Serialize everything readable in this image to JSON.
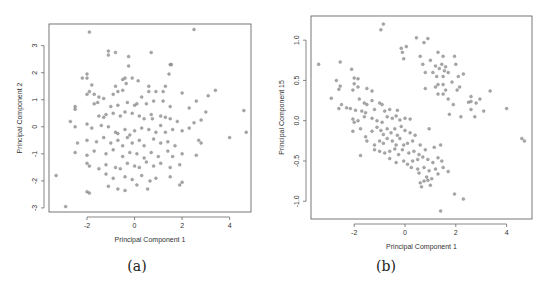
{
  "chart_data": [
    {
      "type": "scatter",
      "panel_label": "(a)",
      "xlabel": "Principal Component 1",
      "ylabel": "Principal Component 2",
      "xticks": [
        -2,
        0,
        2,
        4
      ],
      "yticks": [
        -3,
        -2,
        -1,
        0,
        1,
        2,
        3
      ],
      "xlim": [
        -3.6,
        4.9
      ],
      "ylim": [
        -3.15,
        3.8
      ],
      "grid": false,
      "legend": null,
      "point_color": "#8a8a8a",
      "points": [
        [
          -1.9,
          3.5
        ],
        [
          2.5,
          3.6
        ],
        [
          -1.1,
          2.8
        ],
        [
          -1.1,
          2.65
        ],
        [
          -0.8,
          2.75
        ],
        [
          -0.25,
          2.6
        ],
        [
          0.7,
          2.75
        ],
        [
          -0.25,
          2.25
        ],
        [
          1.5,
          2.3
        ],
        [
          1.55,
          2.3
        ],
        [
          1.45,
          1.95
        ],
        [
          -2.0,
          1.95
        ],
        [
          -2.0,
          1.8
        ],
        [
          -2.2,
          1.8
        ],
        [
          -0.4,
          1.8
        ],
        [
          -0.5,
          1.75
        ],
        [
          -0.1,
          1.8
        ],
        [
          0.15,
          1.7
        ],
        [
          -0.35,
          1.6
        ],
        [
          -1.8,
          1.55
        ],
        [
          -0.8,
          1.5
        ],
        [
          0.6,
          1.5
        ],
        [
          1.3,
          1.5
        ],
        [
          -1.9,
          1.3
        ],
        [
          -1.7,
          1.2
        ],
        [
          -2.0,
          1.2
        ],
        [
          -1.5,
          1.1
        ],
        [
          -1.3,
          1.05
        ],
        [
          -0.9,
          1.2
        ],
        [
          -0.7,
          1.3
        ],
        [
          -0.5,
          1.35
        ],
        [
          0.3,
          1.1
        ],
        [
          0.6,
          1.3
        ],
        [
          0.9,
          1.3
        ],
        [
          1.2,
          1.3
        ],
        [
          2.0,
          1.25
        ],
        [
          3.1,
          1.15
        ],
        [
          3.4,
          1.35
        ],
        [
          -2.5,
          0.75
        ],
        [
          -2.5,
          0.65
        ],
        [
          -1.7,
          0.85
        ],
        [
          -1.55,
          0.9
        ],
        [
          -1.0,
          0.75
        ],
        [
          -0.7,
          0.8
        ],
        [
          -0.3,
          0.9
        ],
        [
          0.0,
          0.8
        ],
        [
          0.1,
          0.85
        ],
        [
          0.5,
          0.85
        ],
        [
          0.8,
          0.95
        ],
        [
          1.2,
          0.95
        ],
        [
          1.5,
          0.75
        ],
        [
          2.3,
          0.7
        ],
        [
          2.6,
          0.95
        ],
        [
          3.0,
          0.55
        ],
        [
          4.6,
          0.6
        ],
        [
          -2.7,
          0.2
        ],
        [
          -1.5,
          0.4
        ],
        [
          -1.3,
          0.35
        ],
        [
          -1.2,
          0.45
        ],
        [
          -0.9,
          0.5
        ],
        [
          -0.6,
          0.4
        ],
        [
          -0.4,
          0.55
        ],
        [
          -0.1,
          0.5
        ],
        [
          0.2,
          0.4
        ],
        [
          0.4,
          0.3
        ],
        [
          0.7,
          0.45
        ],
        [
          0.75,
          0.3
        ],
        [
          1.1,
          0.4
        ],
        [
          1.3,
          0.35
        ],
        [
          1.5,
          0.3
        ],
        [
          1.8,
          0.2
        ],
        [
          2.5,
          0.15
        ],
        [
          2.8,
          0.25
        ],
        [
          -2.5,
          0.0
        ],
        [
          -2.0,
          0.1
        ],
        [
          -1.8,
          -0.05
        ],
        [
          -1.4,
          0.05
        ],
        [
          -1.1,
          0.0
        ],
        [
          -0.8,
          -0.2
        ],
        [
          -0.7,
          -0.25
        ],
        [
          -0.4,
          -0.1
        ],
        [
          -0.2,
          -0.3
        ],
        [
          0.0,
          -0.15
        ],
        [
          0.3,
          -0.05
        ],
        [
          0.6,
          -0.1
        ],
        [
          0.9,
          -0.2
        ],
        [
          1.1,
          0.05
        ],
        [
          1.3,
          -0.2
        ],
        [
          1.6,
          -0.1
        ],
        [
          2.0,
          -0.15
        ],
        [
          2.3,
          -0.05
        ],
        [
          4.0,
          -0.4
        ],
        [
          4.7,
          -0.2
        ],
        [
          -2.4,
          -0.6
        ],
        [
          -2.0,
          -0.5
        ],
        [
          -1.6,
          -0.55
        ],
        [
          -1.3,
          -0.4
        ],
        [
          -1.0,
          -0.6
        ],
        [
          -0.7,
          -0.5
        ],
        [
          -0.5,
          -0.7
        ],
        [
          -0.3,
          -0.4
        ],
        [
          -0.1,
          -0.6
        ],
        [
          0.2,
          -0.5
        ],
        [
          0.4,
          -0.7
        ],
        [
          0.8,
          -0.45
        ],
        [
          1.1,
          -0.6
        ],
        [
          1.4,
          -0.55
        ],
        [
          1.7,
          -0.7
        ],
        [
          2.8,
          -0.6
        ],
        [
          2.7,
          -0.5
        ],
        [
          -2.5,
          -0.95
        ],
        [
          -2.0,
          -1.05
        ],
        [
          -1.7,
          -0.9
        ],
        [
          -1.2,
          -1.0
        ],
        [
          -0.9,
          -0.85
        ],
        [
          -0.5,
          -1.1
        ],
        [
          -0.2,
          -0.95
        ],
        [
          0.1,
          -1.0
        ],
        [
          0.4,
          -1.15
        ],
        [
          0.7,
          -0.95
        ],
        [
          1.0,
          -1.1
        ],
        [
          1.4,
          -0.9
        ],
        [
          1.6,
          -1.1
        ],
        [
          2.0,
          -1.0
        ],
        [
          2.6,
          -1.05
        ],
        [
          -2.0,
          -1.35
        ],
        [
          -1.9,
          -1.45
        ],
        [
          -1.5,
          -1.55
        ],
        [
          -1.2,
          -1.4
        ],
        [
          -0.8,
          -1.5
        ],
        [
          -0.6,
          -1.55
        ],
        [
          -0.3,
          -1.35
        ],
        [
          0.0,
          -1.45
        ],
        [
          0.2,
          -1.5
        ],
        [
          0.5,
          -1.3
        ],
        [
          0.8,
          -1.45
        ],
        [
          1.1,
          -1.35
        ],
        [
          1.5,
          -1.5
        ],
        [
          1.9,
          -1.4
        ],
        [
          -3.3,
          -1.8
        ],
        [
          -1.2,
          -1.75
        ],
        [
          -0.9,
          -1.9
        ],
        [
          -0.4,
          -1.85
        ],
        [
          -0.1,
          -1.95
        ],
        [
          0.3,
          -1.8
        ],
        [
          0.9,
          -1.9
        ],
        [
          1.5,
          -1.85
        ],
        [
          2.0,
          -2.05
        ],
        [
          1.9,
          -2.15
        ],
        [
          -1.1,
          -2.2
        ],
        [
          -0.7,
          -2.3
        ],
        [
          -0.4,
          -2.35
        ],
        [
          0.1,
          -2.15
        ],
        [
          0.55,
          -2.3
        ],
        [
          0.65,
          -2.0
        ],
        [
          -2.0,
          -2.4
        ],
        [
          -1.9,
          -2.45
        ],
        [
          -2.9,
          -2.95
        ]
      ]
    },
    {
      "type": "scatter",
      "panel_label": "(b)",
      "xlabel": "Principal Component 1",
      "ylabel": "Principal Component 15",
      "xticks": [
        -2,
        0,
        2,
        4
      ],
      "yticks": [
        -1.0,
        -0.5,
        0.0,
        0.5,
        1.0
      ],
      "xlim": [
        -3.7,
        5.0
      ],
      "ylim": [
        -1.22,
        1.3
      ],
      "grid": false,
      "legend": null,
      "point_color": "#8a8a8a",
      "points": [
        [
          -0.85,
          1.2
        ],
        [
          -0.95,
          1.13
        ],
        [
          0.45,
          1.03
        ],
        [
          0.9,
          1.02
        ],
        [
          0.75,
          0.97
        ],
        [
          0.05,
          0.92
        ],
        [
          -0.15,
          0.9
        ],
        [
          -0.1,
          0.85
        ],
        [
          -0.05,
          0.77
        ],
        [
          1.3,
          0.85
        ],
        [
          1.5,
          0.8
        ],
        [
          1.95,
          0.8
        ],
        [
          2.0,
          0.7
        ],
        [
          0.6,
          0.8
        ],
        [
          0.7,
          0.7
        ],
        [
          1.0,
          0.75
        ],
        [
          1.2,
          0.68
        ],
        [
          1.35,
          0.65
        ],
        [
          1.45,
          0.7
        ],
        [
          1.55,
          0.62
        ],
        [
          1.6,
          0.67
        ],
        [
          1.7,
          0.6
        ],
        [
          1.5,
          0.55
        ],
        [
          1.1,
          0.6
        ],
        [
          0.8,
          0.6
        ],
        [
          1.25,
          0.55
        ],
        [
          2.1,
          0.55
        ],
        [
          2.3,
          0.58
        ],
        [
          1.3,
          0.45
        ],
        [
          1.2,
          0.42
        ],
        [
          1.5,
          0.45
        ],
        [
          0.8,
          0.4
        ],
        [
          1.6,
          0.38
        ],
        [
          1.5,
          0.33
        ],
        [
          1.3,
          0.33
        ],
        [
          1.85,
          0.48
        ],
        [
          2.05,
          0.38
        ],
        [
          2.15,
          0.42
        ],
        [
          2.6,
          0.3
        ],
        [
          2.5,
          0.23
        ],
        [
          2.6,
          0.24
        ],
        [
          2.8,
          0.22
        ],
        [
          2.95,
          0.27
        ],
        [
          3.35,
          0.37
        ],
        [
          1.7,
          0.27
        ],
        [
          1.9,
          0.2
        ],
        [
          2.6,
          0.14
        ],
        [
          2.75,
          0.05
        ],
        [
          3.1,
          0.12
        ],
        [
          4.0,
          0.15
        ],
        [
          1.75,
          0.08
        ],
        [
          2.2,
          0.05
        ],
        [
          4.6,
          -0.22
        ],
        [
          4.7,
          -0.25
        ],
        [
          -3.4,
          0.7
        ],
        [
          -2.55,
          0.73
        ],
        [
          -2.1,
          0.64
        ],
        [
          -2.0,
          0.53
        ],
        [
          -1.85,
          0.52
        ],
        [
          -2.7,
          0.5
        ],
        [
          -2.55,
          0.43
        ],
        [
          -2.6,
          0.39
        ],
        [
          -2.0,
          0.46
        ],
        [
          -2.05,
          0.38
        ],
        [
          -1.85,
          0.42
        ],
        [
          -1.5,
          0.4
        ],
        [
          -1.3,
          0.37
        ],
        [
          -2.9,
          0.28
        ],
        [
          -1.8,
          0.27
        ],
        [
          -1.6,
          0.22
        ],
        [
          -1.5,
          0.2
        ],
        [
          -1.3,
          0.25
        ],
        [
          -1.0,
          0.22
        ],
        [
          -0.9,
          0.2
        ],
        [
          -2.5,
          0.2
        ],
        [
          -2.3,
          0.16
        ],
        [
          -2.6,
          0.15
        ],
        [
          -2.15,
          0.15
        ],
        [
          -1.95,
          0.13
        ],
        [
          -1.7,
          0.12
        ],
        [
          -1.55,
          0.1
        ],
        [
          -1.2,
          0.14
        ],
        [
          -0.8,
          0.12
        ],
        [
          -0.6,
          0.14
        ],
        [
          -0.3,
          0.13
        ],
        [
          -2.05,
          0.02
        ],
        [
          -2.0,
          -0.02
        ],
        [
          -1.85,
          0.0
        ],
        [
          -1.6,
          0.05
        ],
        [
          -1.3,
          0.03
        ],
        [
          -1.1,
          0.0
        ],
        [
          -0.9,
          -0.02
        ],
        [
          -0.7,
          0.05
        ],
        [
          -0.5,
          0.03
        ],
        [
          -0.35,
          0.06
        ],
        [
          -0.2,
          0.01
        ],
        [
          0.0,
          0.03
        ],
        [
          0.2,
          0.02
        ],
        [
          -2.05,
          -0.13
        ],
        [
          -1.75,
          -0.1
        ],
        [
          -1.55,
          -0.2
        ],
        [
          -1.3,
          -0.13
        ],
        [
          -1.1,
          -0.08
        ],
        [
          -0.95,
          -0.12
        ],
        [
          -0.85,
          -0.17
        ],
        [
          -0.7,
          -0.1
        ],
        [
          -0.55,
          -0.15
        ],
        [
          -0.4,
          -0.1
        ],
        [
          -0.3,
          -0.18
        ],
        [
          -0.15,
          -0.07
        ],
        [
          0.0,
          -0.12
        ],
        [
          0.2,
          -0.15
        ],
        [
          0.4,
          -0.18
        ],
        [
          0.95,
          -0.1
        ],
        [
          -1.5,
          -0.25
        ],
        [
          -1.2,
          -0.3
        ],
        [
          -1.0,
          -0.25
        ],
        [
          -0.85,
          -0.28
        ],
        [
          -0.7,
          -0.22
        ],
        [
          -0.5,
          -0.25
        ],
        [
          -0.35,
          -0.3
        ],
        [
          -0.2,
          -0.22
        ],
        [
          -0.05,
          -0.3
        ],
        [
          0.1,
          -0.28
        ],
        [
          0.3,
          -0.25
        ],
        [
          0.6,
          -0.3
        ],
        [
          -1.2,
          -0.36
        ],
        [
          -1.0,
          -0.38
        ],
        [
          -0.8,
          -0.4
        ],
        [
          -0.6,
          -0.38
        ],
        [
          -0.4,
          -0.35
        ],
        [
          -0.25,
          -0.42
        ],
        [
          -0.1,
          -0.36
        ],
        [
          0.15,
          -0.4
        ],
        [
          0.35,
          -0.38
        ],
        [
          0.55,
          -0.42
        ],
        [
          0.8,
          -0.36
        ],
        [
          1.15,
          -0.33
        ],
        [
          1.4,
          -0.3
        ],
        [
          -1.75,
          -0.43
        ],
        [
          -0.6,
          -0.47
        ],
        [
          -0.35,
          -0.52
        ],
        [
          -0.05,
          -0.5
        ],
        [
          0.1,
          -0.54
        ],
        [
          0.3,
          -0.5
        ],
        [
          0.5,
          -0.48
        ],
        [
          0.7,
          -0.45
        ],
        [
          0.9,
          -0.48
        ],
        [
          1.1,
          -0.52
        ],
        [
          1.3,
          -0.46
        ],
        [
          1.45,
          -0.5
        ],
        [
          0.25,
          -0.58
        ],
        [
          0.5,
          -0.6
        ],
        [
          0.75,
          -0.58
        ],
        [
          0.95,
          -0.62
        ],
        [
          1.2,
          -0.6
        ],
        [
          1.5,
          -0.58
        ],
        [
          0.55,
          -0.65
        ],
        [
          0.85,
          -0.7
        ],
        [
          1.05,
          -0.72
        ],
        [
          1.3,
          -0.66
        ],
        [
          1.7,
          -0.63
        ],
        [
          0.6,
          -0.77
        ],
        [
          0.75,
          -0.75
        ],
        [
          1.0,
          -0.8
        ],
        [
          0.65,
          -0.82
        ],
        [
          0.9,
          -0.74
        ],
        [
          1.95,
          -0.91
        ],
        [
          2.3,
          -0.97
        ],
        [
          1.4,
          -1.12
        ]
      ]
    }
  ],
  "captions": {
    "a": "(a)",
    "b": "(b)"
  }
}
